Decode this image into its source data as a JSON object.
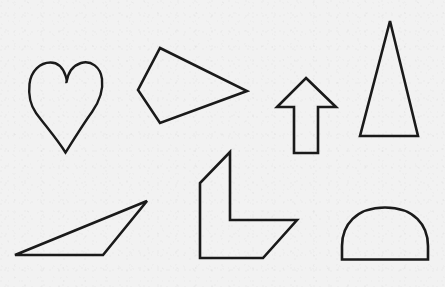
{
  "scene": {
    "title": "Geometric shape outlines",
    "background_color": "#f2f2f2",
    "stroke_color": "#1a1a1a",
    "width": 445,
    "height": 287,
    "shape_count": 7
  },
  "shapes": [
    {
      "id": "heart",
      "name": "heart",
      "label": "Heart",
      "stroke_width": 2.4,
      "closed": true,
      "path": "M 65.5 152.5 C 57 139 44 124 36 113 C 29 103 28.5 93 29.5 84 C 31 71 40 62.5 50.5 62.5 C 58.5 62.5 63 68 65.5 75.5 C 67.5 82 66.5 82 66.5 82 C 68 73 73 65.5 81 63 C 91 60 100.5 67 102 79 C 103.5 91 99 102 92 112 C 84 123 74 139 65.5 152.5 Z",
      "bbox": [
        29,
        61,
        104,
        153
      ]
    },
    {
      "id": "quadrilateral-dart",
      "name": "quadrilateral",
      "label": "Quadrilateral (kite)",
      "stroke_width": 2.6,
      "closed": true,
      "points": [
        [
          160,
          48
        ],
        [
          247,
          91
        ],
        [
          160,
          123
        ],
        [
          138,
          90
        ]
      ],
      "bbox": [
        137,
        47,
        248,
        124
      ]
    },
    {
      "id": "arrow-up",
      "name": "up-arrow",
      "label": "Up arrow",
      "stroke_width": 2.6,
      "closed": true,
      "points": [
        [
          306,
          78
        ],
        [
          336,
          107
        ],
        [
          318,
          107
        ],
        [
          318,
          153
        ],
        [
          294,
          153
        ],
        [
          294,
          107
        ],
        [
          277,
          107
        ]
      ],
      "bbox": [
        276,
        77,
        337,
        154
      ]
    },
    {
      "id": "triangle-tall",
      "name": "tall-triangle",
      "label": "Tall triangle",
      "stroke_width": 2.6,
      "closed": true,
      "points": [
        [
          390,
          21
        ],
        [
          418,
          136
        ],
        [
          360,
          136
        ]
      ],
      "bbox": [
        359,
        20,
        419,
        137
      ]
    },
    {
      "id": "triangle-thin",
      "name": "thin-triangle",
      "label": "Thin triangle",
      "stroke_width": 2.6,
      "closed": true,
      "points": [
        [
          147,
          201
        ],
        [
          103,
          255
        ],
        [
          15,
          255
        ]
      ],
      "bbox": [
        14,
        200,
        148,
        256
      ]
    },
    {
      "id": "polygon-hook",
      "name": "hook-polygon",
      "label": "Hook / L polygon",
      "stroke_width": 2.6,
      "closed": true,
      "points": [
        [
          230,
          152
        ],
        [
          230,
          220
        ],
        [
          297,
          220
        ],
        [
          263,
          258
        ],
        [
          200,
          258
        ],
        [
          200,
          183
        ]
      ],
      "bbox": [
        199,
        151,
        298,
        259
      ]
    },
    {
      "id": "dome-semicircle",
      "name": "dome",
      "label": "Dome (half ellipse)",
      "stroke_width": 2.6,
      "closed": true,
      "path": "M 342 259.5 L 342 246 C 342 225 356 207.5 385 207.5 C 414 207.5 428 225 428 246 L 428 259.5 Z",
      "bbox": [
        341,
        206,
        429,
        260
      ]
    }
  ]
}
